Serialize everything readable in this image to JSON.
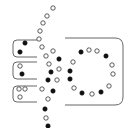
{
  "diagram": {
    "colors": {
      "background": "#ffffff",
      "frame_stroke": "#555555",
      "filled_dot": "#111111",
      "open_dot_stroke": "#333333"
    },
    "frames": [
      {
        "id": "small-frame-1",
        "x": 13,
        "y": 40,
        "w": 24,
        "h": 17
      },
      {
        "id": "small-frame-2",
        "x": 13,
        "y": 62,
        "w": 24,
        "h": 17
      },
      {
        "id": "small-frame-3",
        "x": 13,
        "y": 86,
        "w": 24,
        "h": 16
      },
      {
        "id": "large-frame",
        "x": 65,
        "y": 38,
        "w": 58,
        "h": 67
      }
    ],
    "small_frame_dots": [
      {
        "x": 25,
        "y": 43,
        "filled": true
      },
      {
        "x": 20,
        "y": 52,
        "filled": true
      },
      {
        "x": 20,
        "y": 66,
        "filled": false
      },
      {
        "x": 22,
        "y": 74,
        "filled": true
      },
      {
        "x": 19,
        "y": 89,
        "filled": false
      },
      {
        "x": 25,
        "y": 89,
        "filled": false
      },
      {
        "x": 20,
        "y": 97,
        "filled": false
      }
    ],
    "chain_dots": [
      {
        "x": 53,
        "y": 8,
        "filled": false
      },
      {
        "x": 47,
        "y": 16,
        "filled": false
      },
      {
        "x": 43,
        "y": 23,
        "filled": false
      },
      {
        "x": 40,
        "y": 31,
        "filled": false
      },
      {
        "x": 39,
        "y": 39,
        "filled": false
      },
      {
        "x": 42,
        "y": 47,
        "filled": false
      },
      {
        "x": 53,
        "y": 51,
        "filled": false
      },
      {
        "x": 46,
        "y": 56,
        "filled": false
      },
      {
        "x": 59,
        "y": 59,
        "filled": true
      },
      {
        "x": 49,
        "y": 64,
        "filled": false
      },
      {
        "x": 59,
        "y": 69,
        "filled": false
      },
      {
        "x": 51,
        "y": 72,
        "filled": true
      },
      {
        "x": 48,
        "y": 80,
        "filled": true
      },
      {
        "x": 57,
        "y": 80,
        "filled": false
      },
      {
        "x": 42,
        "y": 89,
        "filled": false
      },
      {
        "x": 53,
        "y": 91,
        "filled": true
      },
      {
        "x": 48,
        "y": 99,
        "filled": false
      },
      {
        "x": 45,
        "y": 109,
        "filled": true
      },
      {
        "x": 46,
        "y": 118,
        "filled": false
      },
      {
        "x": 48,
        "y": 126,
        "filled": true
      }
    ],
    "ring_dots": [
      {
        "x": 81,
        "y": 52,
        "filled": true
      },
      {
        "x": 89,
        "y": 50,
        "filled": false
      },
      {
        "x": 97,
        "y": 51,
        "filled": false
      },
      {
        "x": 106,
        "y": 56,
        "filled": true
      },
      {
        "x": 112,
        "y": 65,
        "filled": false
      },
      {
        "x": 113,
        "y": 74,
        "filled": false
      },
      {
        "x": 109,
        "y": 86,
        "filled": false
      },
      {
        "x": 101,
        "y": 92,
        "filled": true
      },
      {
        "x": 92,
        "y": 94,
        "filled": false
      },
      {
        "x": 82,
        "y": 93,
        "filled": true
      },
      {
        "x": 74,
        "y": 88,
        "filled": false
      },
      {
        "x": 70,
        "y": 79,
        "filled": true
      },
      {
        "x": 70,
        "y": 71,
        "filled": true
      },
      {
        "x": 73,
        "y": 62,
        "filled": false
      }
    ],
    "dot_radius": 2.2
  }
}
